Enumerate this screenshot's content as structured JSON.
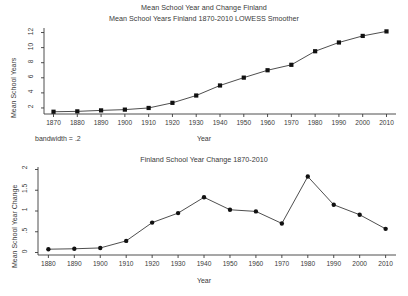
{
  "figure": {
    "suptitle": "Mean School Year and Change Finland",
    "background": "#ffffff",
    "ink": "#2b2b2b",
    "width": 408,
    "height": 296
  },
  "chart_data": [
    {
      "type": "line",
      "id": "mean-school-years",
      "title": "Mean School Years Finland 1870-2010 LOWESS Smoother",
      "xlabel": "Year",
      "ylabel": "Mean School Years",
      "annotation": "bandwidth = .2",
      "grid": false,
      "legend": "none",
      "marker": "filled-square",
      "line_color": "#3a3a3a",
      "marker_color": "#111111",
      "xlim": [
        1866,
        2014
      ],
      "ylim": [
        1.2,
        12.6
      ],
      "xticks": [
        1870,
        1880,
        1890,
        1900,
        1910,
        1920,
        1930,
        1940,
        1950,
        1960,
        1970,
        1980,
        1990,
        2000,
        2010
      ],
      "xtick_labels": [
        "1870",
        "1880",
        "1890",
        "1900",
        "1910",
        "1920",
        "1930",
        "1940",
        "1950",
        "1960",
        "1970",
        "1980",
        "1990",
        "2000",
        "2010"
      ],
      "yticks": [
        2,
        4,
        6,
        8,
        10,
        12
      ],
      "ytick_labels": [
        "2",
        "4",
        "6",
        "8",
        "10",
        "12"
      ],
      "x": [
        1870,
        1880,
        1890,
        1900,
        1910,
        1920,
        1930,
        1940,
        1950,
        1960,
        1970,
        1980,
        1990,
        2000,
        2010
      ],
      "values": [
        1.5,
        1.55,
        1.68,
        1.78,
        2.0,
        2.68,
        3.65,
        4.98,
        6.02,
        7.0,
        7.72,
        9.52,
        10.68,
        11.55,
        12.15
      ]
    },
    {
      "type": "line",
      "id": "school-year-change",
      "title": "Finland School Year Change 1870-2010",
      "xlabel": "Year",
      "ylabel": "Mean School Year Change",
      "grid": false,
      "legend": "none",
      "marker": "filled-circle",
      "line_color": "#3a3a3a",
      "marker_color": "#111111",
      "xlim": [
        1876,
        2014
      ],
      "ylim": [
        -0.06,
        2.06
      ],
      "xticks": [
        1880,
        1890,
        1900,
        1910,
        1920,
        1930,
        1940,
        1950,
        1960,
        1970,
        1980,
        1990,
        2000,
        2010
      ],
      "xtick_labels": [
        "1880",
        "1890",
        "1900",
        "1910",
        "1920",
        "1930",
        "1940",
        "1950",
        "1960",
        "1970",
        "1980",
        "1990",
        "2000",
        "2010"
      ],
      "yticks": [
        0,
        0.5,
        1,
        1.5,
        2
      ],
      "ytick_labels": [
        "0",
        ".5",
        "1",
        "1.5",
        "2"
      ],
      "x": [
        1880,
        1890,
        1900,
        1910,
        1920,
        1930,
        1940,
        1950,
        1960,
        1970,
        1980,
        1990,
        2000,
        2010
      ],
      "values": [
        0.08,
        0.09,
        0.11,
        0.28,
        0.72,
        0.95,
        1.33,
        1.03,
        0.99,
        0.7,
        1.83,
        1.15,
        0.91,
        0.57
      ]
    }
  ]
}
